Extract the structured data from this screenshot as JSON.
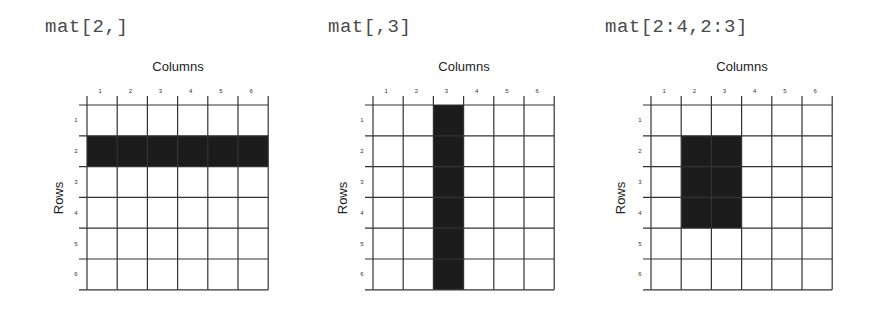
{
  "panels": [
    {
      "expression": "mat[2,]",
      "x_label": "Columns",
      "y_label": "Rows",
      "col_labels": [
        "1",
        "2",
        "3",
        "4",
        "5",
        "6"
      ],
      "row_labels": [
        "1",
        "2",
        "3",
        "4",
        "5",
        "6"
      ],
      "highlight": {
        "rows": [
          2
        ],
        "cols": [
          1,
          2,
          3,
          4,
          5,
          6
        ]
      }
    },
    {
      "expression": "mat[,3]",
      "x_label": "Columns",
      "y_label": "Rows",
      "col_labels": [
        "1",
        "2",
        "3",
        "4",
        "5",
        "6"
      ],
      "row_labels": [
        "1",
        "2",
        "3",
        "4",
        "5",
        "6"
      ],
      "highlight": {
        "rows": [
          1,
          2,
          3,
          4,
          5,
          6
        ],
        "cols": [
          3
        ]
      }
    },
    {
      "expression": "mat[2:4,2:3]",
      "x_label": "Columns",
      "y_label": "Rows",
      "col_labels": [
        "1",
        "2",
        "3",
        "4",
        "5",
        "6"
      ],
      "row_labels": [
        "1",
        "2",
        "3",
        "4",
        "5",
        "6"
      ],
      "highlight": {
        "rows": [
          2,
          3,
          4
        ],
        "cols": [
          2,
          3
        ]
      }
    }
  ],
  "colors": {
    "highlight": "#1c1c1c",
    "grid_line": "#333333",
    "expression_text": "#4a4a4a"
  }
}
